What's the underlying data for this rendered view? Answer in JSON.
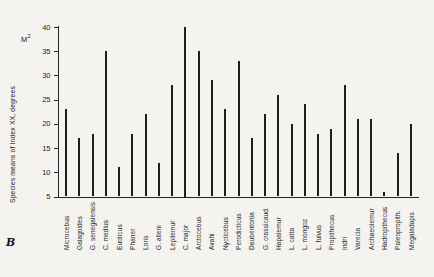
{
  "figure": {
    "panel_letter": "B",
    "corner_label": {
      "base": "M",
      "sup": "2"
    }
  },
  "chart_data": {
    "type": "bar",
    "title": "",
    "xlabel": "",
    "ylabel": "Species means of Index XX, degrees",
    "ylim": [
      5,
      40
    ],
    "yticks": [
      5,
      10,
      15,
      20,
      25,
      30,
      35,
      40
    ],
    "grid": false,
    "legend": false,
    "bar_color": "#1e1e1e",
    "background": "#f4f3f0",
    "categories": [
      "Microcebus",
      "Galagoides",
      "G. senegalensis",
      "C. medius",
      "Euoticus",
      "Phaner",
      "Loris",
      "G. alleni",
      "Lepilemur",
      "C. major",
      "Arctocebus",
      "Avahi",
      "Nycticebus",
      "Perodicticus",
      "Daubentonia",
      "G. crassicaud.",
      "Hapalemur",
      "L. catta",
      "L. mongoz",
      "L. fulvus",
      "Propithecus",
      "Indri",
      "Varecia",
      "Archaeolemur",
      "Hadropithecus",
      "Paleopropith.",
      "Megaladapis"
    ],
    "values": [
      23,
      17,
      18,
      35,
      11,
      18,
      22,
      12,
      28,
      40,
      35,
      29,
      23,
      33,
      17,
      22,
      26,
      20,
      24,
      18,
      19,
      28,
      21,
      21,
      6,
      14,
      20
    ]
  }
}
